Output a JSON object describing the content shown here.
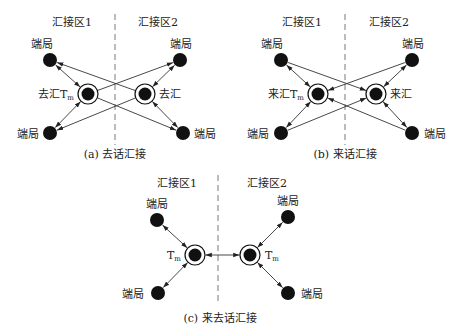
{
  "colors": {
    "ink": "#111111",
    "line": "#333333",
    "background": "#ffffff"
  },
  "panels": [
    {
      "id": "a",
      "caption": "(a) 去话汇接",
      "zone_left": "汇接区1",
      "zone_right": "汇接区2",
      "end_office_label": "端局",
      "hub_left_label": "去汇T",
      "hub_left_sub": "m",
      "hub_right_label": "去汇",
      "hub_right_sub": "",
      "mode": "outgoing"
    },
    {
      "id": "b",
      "caption": "(b) 来话汇接",
      "zone_left": "汇接区1",
      "zone_right": "汇接区2",
      "end_office_label": "端局",
      "hub_left_label": "来汇T",
      "hub_left_sub": "m",
      "hub_right_label": "来汇",
      "hub_right_sub": "",
      "mode": "incoming"
    },
    {
      "id": "c",
      "caption": "(c) 来去话汇接",
      "zone_left": "汇接区1",
      "zone_right": "汇接区2",
      "end_office_label": "端局",
      "hub_left_label": "T",
      "hub_left_sub": "m",
      "hub_right_label": "T",
      "hub_right_sub": "m",
      "mode": "both"
    }
  ]
}
